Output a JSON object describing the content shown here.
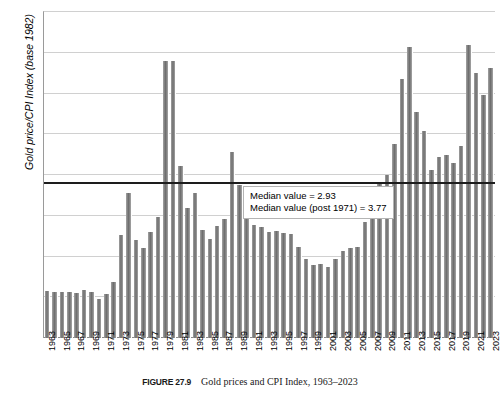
{
  "chart_data": {
    "type": "bar",
    "title": "",
    "xlabel": "",
    "ylabel": "Gold price/CPI Index (base 1982)",
    "ylim": [
      0,
      8
    ],
    "ytick_labels": [
      "0.00",
      "1.00",
      "2.00",
      "3.00",
      "4.00",
      "5.00",
      "6.00",
      "7.00",
      "8.00"
    ],
    "ytick_values": [
      0,
      1,
      2,
      3,
      4,
      5,
      6,
      7,
      8
    ],
    "grid": true,
    "legend": "none",
    "categories": [
      "1963",
      "1964",
      "1965",
      "1966",
      "1967",
      "1968",
      "1969",
      "1970",
      "1971",
      "1972",
      "1973",
      "1974",
      "1975",
      "1976",
      "1977",
      "1978",
      "1979",
      "1980",
      "1981",
      "1982",
      "1983",
      "1984",
      "1985",
      "1986",
      "1987",
      "1988",
      "1989",
      "1990",
      "1991",
      "1992",
      "1993",
      "1994",
      "1995",
      "1996",
      "1997",
      "1998",
      "1999",
      "2000",
      "2001",
      "2002",
      "2003",
      "2004",
      "2005",
      "2006",
      "2007",
      "2008",
      "2009",
      "2010",
      "2011",
      "2012",
      "2013",
      "2014",
      "2015",
      "2016",
      "2017",
      "2018",
      "2019",
      "2020",
      "2021",
      "2022",
      "2023"
    ],
    "tick_label_years": [
      "1963",
      "1965",
      "1967",
      "1969",
      "1971",
      "1973",
      "1975",
      "1977",
      "1979",
      "1981",
      "1983",
      "1985",
      "1987",
      "1989",
      "1991",
      "1993",
      "1995",
      "1997",
      "1999",
      "2001",
      "2003",
      "2005",
      "2007",
      "2009",
      "2011",
      "2013",
      "2015",
      "2017",
      "2019",
      "2021",
      "2023"
    ],
    "values": [
      1.15,
      1.14,
      1.13,
      1.12,
      1.1,
      1.18,
      1.12,
      0.96,
      1.07,
      1.38,
      2.52,
      3.55,
      2.4,
      2.22,
      2.6,
      2.97,
      6.8,
      6.8,
      4.22,
      3.19,
      3.55,
      2.66,
      2.42,
      2.76,
      2.93,
      4.56,
      3.76,
      3.26,
      2.78,
      2.73,
      2.6,
      2.62,
      2.57,
      2.56,
      2.23,
      1.94,
      1.8,
      1.81,
      1.74,
      1.93,
      2.13,
      2.21,
      2.24,
      2.84,
      3.1,
      3.82,
      4.0,
      4.76,
      6.35,
      7.15,
      5.54,
      5.08,
      4.12,
      4.44,
      4.5,
      4.29,
      4.71,
      7.18,
      6.5,
      5.97,
      6.62
    ],
    "annotations": [
      {
        "text": "Median value = 2.93",
        "value": 2.93
      },
      {
        "text": "Median value (post 1971) = 3.77",
        "value": 3.77
      }
    ],
    "reference_line": {
      "name": "median-post-1971",
      "value": 3.77,
      "color": "#1d1d1d"
    }
  },
  "caption": {
    "figure_number": "FIGURE 27.9",
    "figure_title": "Gold prices and CPI Index, 1963–2023"
  },
  "colors": {
    "bar": "#7f7f7f",
    "gridline": "#d0d0d0",
    "axis": "#8a8a8a",
    "reference_line": "#1d1d1d",
    "text": "#000000"
  }
}
